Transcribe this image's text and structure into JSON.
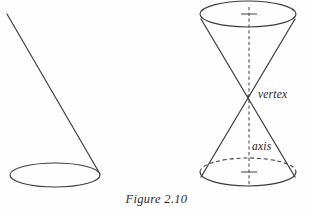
{
  "figure": {
    "caption": "Figure 2.10",
    "background_color": "#fefefe",
    "stroke_color": "#3a3a40",
    "label_color": "#26262a",
    "labels": {
      "vertex": "vertex",
      "axis": "axis"
    },
    "left_diagram": {
      "name": "single-nappe-cone-outline",
      "base_ellipse": {
        "cx": 55,
        "cy": 175,
        "rx": 45,
        "ry": 12
      },
      "generator_line": {
        "x1": 7,
        "y1": 14,
        "x2": 100,
        "y2": 174
      }
    },
    "right_diagram": {
      "name": "double-napped-cone",
      "vertex_point": {
        "x": 248,
        "y": 96
      },
      "top_ellipse": {
        "cx": 248,
        "cy": 14,
        "rx": 48,
        "ry": 13
      },
      "bottom_ellipse": {
        "cx": 248,
        "cy": 172,
        "rx": 48,
        "ry": 14
      },
      "axis_line": {
        "x1": 249,
        "y1": 8,
        "x2": 249,
        "y2": 186,
        "style": "dashed"
      },
      "axis_tick_top": {
        "cx": 249,
        "cy": 14,
        "half_width": 8
      },
      "axis_tick_bottom": {
        "cx": 249,
        "cy": 172,
        "half_width": 8
      },
      "side_lines": [
        {
          "x1": 202,
          "y1": 19,
          "x2": 294,
          "y2": 176
        },
        {
          "x1": 294,
          "y1": 19,
          "x2": 202,
          "y2": 176
        }
      ]
    }
  }
}
